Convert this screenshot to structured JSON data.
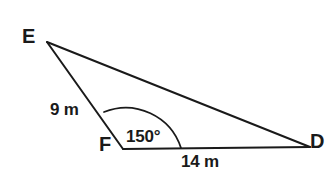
{
  "figure": {
    "type": "triangle-diagram",
    "background_color": "#ffffff",
    "stroke_color": "#1a1a1a",
    "text_color": "#1a1a1a",
    "vertices": {
      "E": {
        "label": "E",
        "x": 47,
        "y": 42
      },
      "F": {
        "label": "F",
        "x": 123,
        "y": 149
      },
      "D": {
        "label": "D",
        "x": 310,
        "y": 147
      }
    },
    "sides": {
      "ef": {
        "label": "9 m",
        "value": 9,
        "unit": "m",
        "from": "E",
        "to": "F"
      },
      "fd": {
        "label": "14 m",
        "value": 14,
        "unit": "m",
        "from": "F",
        "to": "D"
      },
      "ed": {
        "label": "",
        "from": "E",
        "to": "D"
      }
    },
    "angles": {
      "f": {
        "label": "150°",
        "value": 150,
        "unit": "degrees",
        "at_vertex": "F"
      }
    },
    "arc": {
      "name": "angle-arc-f",
      "start_x": 104,
      "start_y": 112,
      "end_x": 181,
      "end_y": 148
    }
  }
}
